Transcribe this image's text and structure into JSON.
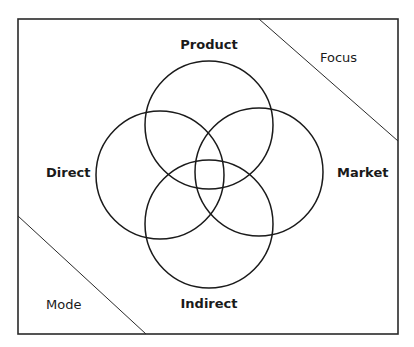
{
  "diagram": {
    "type": "venn-four-circle",
    "frame": {
      "x": 18,
      "y": 19,
      "width": 380,
      "height": 315,
      "stroke": "#2a2a2a"
    },
    "circles": [
      {
        "id": "product",
        "label": "Product",
        "cx": 209,
        "cy": 125,
        "r": 64
      },
      {
        "id": "direct",
        "label": "Direct",
        "cx": 160,
        "cy": 175,
        "r": 64
      },
      {
        "id": "market",
        "label": "Market",
        "cx": 259,
        "cy": 172,
        "r": 64
      },
      {
        "id": "indirect",
        "label": "Indirect",
        "cx": 209,
        "cy": 224,
        "r": 64
      }
    ],
    "dividers": [
      {
        "id": "focus-divider",
        "x1": 259,
        "y1": 19,
        "x2": 398,
        "y2": 141
      },
      {
        "id": "mode-divider",
        "x1": 18,
        "y1": 216,
        "x2": 146,
        "y2": 334
      }
    ],
    "labels": {
      "product": "Product",
      "direct": "Direct",
      "market": "Market",
      "indirect": "Indirect",
      "focus": "Focus",
      "mode": "Mode"
    },
    "stroke_color": "#1a1a1a"
  }
}
